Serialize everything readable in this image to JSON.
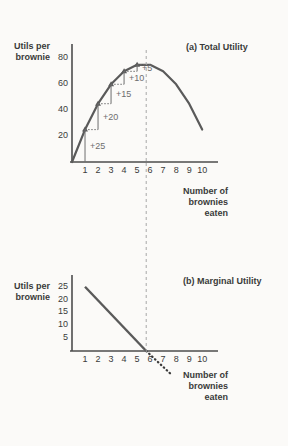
{
  "chart_data": [
    {
      "type": "line",
      "title": "(a) Total Utility",
      "ylabel": "Utils per\nbrownie",
      "xlabel": "Number of\nbrownies\neaten",
      "xlim": [
        0,
        10.6
      ],
      "ylim": [
        0,
        88
      ],
      "xticks": [
        "1",
        "2",
        "3",
        "4",
        "5",
        "6",
        "7",
        "8",
        "9",
        "10"
      ],
      "yticks": [
        "20",
        "40",
        "60",
        "80"
      ],
      "ytick_values": [
        20,
        40,
        60,
        80
      ],
      "grid": false,
      "legend": "none",
      "x": [
        0,
        1,
        2,
        3,
        4,
        5,
        6,
        7,
        8,
        9,
        10
      ],
      "values": [
        0,
        25,
        45,
        60,
        70,
        75,
        75,
        70,
        60,
        45,
        25
      ],
      "marker_points": [
        {
          "x": 1,
          "y": 25
        },
        {
          "x": 2,
          "y": 45
        },
        {
          "x": 3,
          "y": 60
        },
        {
          "x": 4,
          "y": 70
        },
        {
          "x": 5,
          "y": 75
        }
      ],
      "annotations": [
        {
          "label": "+25",
          "x": 1,
          "from_y": 0,
          "to_y": 25
        },
        {
          "label": "+20",
          "x": 2,
          "from_y": 25,
          "to_y": 45
        },
        {
          "label": "+15",
          "x": 3,
          "from_y": 45,
          "to_y": 60
        },
        {
          "label": "+10",
          "x": 4,
          "from_y": 60,
          "to_y": 70
        },
        {
          "label": "+5",
          "x": 5,
          "from_y": 70,
          "to_y": 75
        }
      ],
      "reference_line_x": 5.7
    },
    {
      "type": "line",
      "title": "(b) Marginal Utility",
      "ylabel": "Utils per\nbrownie",
      "xlabel": "Number of\nbrownies\neaten",
      "xlim": [
        0,
        10.6
      ],
      "ylim": [
        0,
        28
      ],
      "xticks": [
        "1",
        "2",
        "3",
        "4",
        "5",
        "6",
        "7",
        "8",
        "9",
        "10"
      ],
      "yticks": [
        "5",
        "10",
        "15",
        "20",
        "25"
      ],
      "ytick_values": [
        5,
        10,
        15,
        20,
        25
      ],
      "grid": false,
      "legend": "none",
      "x": [
        1,
        5.7
      ],
      "values": [
        25,
        0
      ],
      "dotted_extension": {
        "x": [
          5.7,
          7.6
        ],
        "values": [
          0,
          -9
        ]
      },
      "reference_line_x": 5.7
    }
  ],
  "style": {
    "curve_color": "#5a5a5a",
    "axis_color": "#4d4d4d",
    "text_color": "#3a3a3a",
    "annotation_color": "#6e6e6e",
    "dashed_color": "#a8a8a8",
    "background": "#fbfaf8"
  }
}
